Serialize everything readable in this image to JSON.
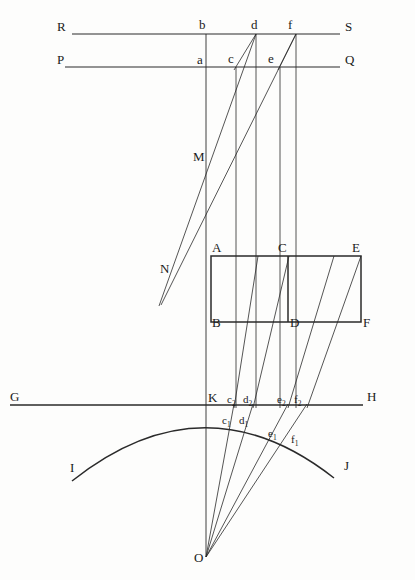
{
  "figure": {
    "background_color": "#fdfdfc",
    "stroke_color": "#2a2a2a",
    "canvas": {
      "width": 415,
      "height": 580
    }
  },
  "labels": {
    "R": "R",
    "S": "S",
    "P": "P",
    "Q": "Q",
    "a": "a",
    "b": "b",
    "c": "c",
    "d": "d",
    "e": "e",
    "f": "f",
    "M": "M",
    "N": "N",
    "A": "A",
    "B": "B",
    "C": "C",
    "D": "D",
    "E": "E",
    "F": "F",
    "G": "G",
    "H": "H",
    "K": "K",
    "I": "I",
    "J": "J",
    "O": "O",
    "c2_base": "c",
    "c2_sub": "2",
    "d2_base": "d",
    "d2_sub": "2",
    "e2_base": "e",
    "e2_sub": "2",
    "f2_base": "f",
    "f2_sub": "2",
    "c1_base": "c",
    "c1_sub": "1",
    "d1_base": "d",
    "d1_sub": "1",
    "e1_base": "e",
    "e1_sub": "1",
    "f1_base": "f",
    "f1_sub": "1"
  },
  "label_positions": {
    "R": {
      "x": 57,
      "y": 31
    },
    "S": {
      "x": 345,
      "y": 31
    },
    "P": {
      "x": 57,
      "y": 64
    },
    "Q": {
      "x": 345,
      "y": 64
    },
    "b": {
      "x": 199,
      "y": 29
    },
    "d": {
      "x": 251,
      "y": 29
    },
    "f": {
      "x": 288,
      "y": 29
    },
    "a": {
      "x": 197,
      "y": 64
    },
    "c": {
      "x": 233,
      "y": 63
    },
    "e": {
      "x": 271,
      "y": 63
    },
    "M": {
      "x": 193,
      "y": 161
    },
    "N": {
      "x": 160,
      "y": 273
    },
    "A": {
      "x": 209,
      "y": 254
    },
    "C": {
      "x": 277,
      "y": 254
    },
    "E": {
      "x": 357,
      "y": 254
    },
    "B": {
      "x": 209,
      "y": 327
    },
    "D": {
      "x": 284,
      "y": 327
    },
    "F": {
      "x": 357,
      "y": 327
    },
    "G": {
      "x": 10,
      "y": 402
    },
    "H": {
      "x": 368,
      "y": 401
    },
    "K": {
      "x": 207,
      "y": 402
    },
    "I": {
      "x": 70,
      "y": 472
    },
    "J": {
      "x": 344,
      "y": 470
    },
    "O": {
      "x": 195,
      "y": 561
    },
    "c2": {
      "x": 226,
      "y": 403
    },
    "d2": {
      "x": 243,
      "y": 403
    },
    "e2": {
      "x": 277,
      "y": 403
    },
    "f2": {
      "x": 292,
      "y": 403
    },
    "c1": {
      "x": 222,
      "y": 424
    },
    "d1": {
      "x": 239,
      "y": 424
    },
    "e1": {
      "x": 270,
      "y": 436
    },
    "f1": {
      "x": 292,
      "y": 441
    }
  },
  "geometry": {
    "horizontal_lines": [
      {
        "name": "line-RS",
        "x1": 72,
        "y1": 34,
        "x2": 340,
        "y2": 34
      },
      {
        "name": "line-PQ",
        "x1": 65,
        "y1": 67,
        "x2": 340,
        "y2": 67
      },
      {
        "name": "line-GH",
        "x1": 10,
        "y1": 405,
        "x2": 363,
        "y2": 405
      }
    ],
    "vertical_lines": [
      {
        "name": "axis-main-vertical",
        "x": 206,
        "y1": 34,
        "y2": 557
      },
      {
        "name": "vertical-through-c",
        "x": 236,
        "y1": 67,
        "y2": 408
      },
      {
        "name": "vertical-through-d",
        "x": 256,
        "y1": 34,
        "y2": 408
      },
      {
        "name": "vertical-through-e",
        "x": 280,
        "y1": 67,
        "y2": 408
      },
      {
        "name": "vertical-through-f",
        "x": 296,
        "y1": 34,
        "y2": 408
      },
      {
        "name": "segment-CD",
        "x": 288,
        "y1": 256,
        "y2": 322
      }
    ],
    "rectangle": {
      "name": "rectangle-ABFE",
      "left": 211,
      "top": 256,
      "right": 361,
      "bottom": 322
    },
    "slanted_lines": [
      {
        "name": "slant-d-to-N",
        "x1": 256,
        "y1": 34,
        "x2": 159,
        "y2": 306
      },
      {
        "name": "slant-f-to-N",
        "x1": 296,
        "y1": 34,
        "x2": 161,
        "y2": 305
      },
      {
        "name": "slant-c-down",
        "x1": 236,
        "y1": 67,
        "x2": 208,
        "y2": 152
      },
      {
        "name": "slant-e-down",
        "x1": 280,
        "y1": 67,
        "x2": 252,
        "y2": 152
      }
    ],
    "rays_from_O": [
      {
        "name": "ray-O-to-c2",
        "x1": 206,
        "y1": 557,
        "x2": 234,
        "y2": 404
      },
      {
        "name": "ray-O-to-d2",
        "x1": 206,
        "y1": 557,
        "x2": 253,
        "y2": 404
      },
      {
        "name": "ray-O-to-e2",
        "x1": 206,
        "y1": 557,
        "x2": 288,
        "y2": 404
      },
      {
        "name": "ray-O-to-f2",
        "x1": 206,
        "y1": 557,
        "x2": 307,
        "y2": 404
      }
    ],
    "long_diagonals": [
      {
        "name": "diagonal-from-c2-upward",
        "x1": 234,
        "y1": 404,
        "x2": 258,
        "y2": 256
      },
      {
        "name": "diagonal-from-d2-upward",
        "x1": 253,
        "y1": 404,
        "x2": 289,
        "y2": 256
      },
      {
        "name": "diagonal-from-e2-upward",
        "x1": 288,
        "y1": 404,
        "x2": 334,
        "y2": 256
      },
      {
        "name": "diagonal-from-f2-upward",
        "x1": 307,
        "y1": 404,
        "x2": 361,
        "y2": 256
      }
    ],
    "arc_IJ": {
      "name": "arc-IKJ",
      "start": {
        "x": 72,
        "y": 481
      },
      "control": {
        "x": 204,
        "y": 376
      },
      "end": {
        "x": 334,
        "y": 478
      }
    },
    "point_O": {
      "x": 206,
      "y": 557
    },
    "point_K": {
      "x": 206,
      "y": 405
    }
  }
}
